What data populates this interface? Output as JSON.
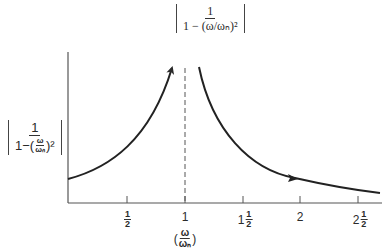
{
  "figure": {
    "top_formula": {
      "numerator": "1",
      "denominator": "1 − (ω/ωₙ)²"
    },
    "y_axis_label": {
      "numerator": "1",
      "denominator_prefix": "1−(",
      "inner_num": "ω",
      "inner_den": "ωₙ",
      "denominator_suffix": ")²"
    },
    "x_axis_label": {
      "open": "(",
      "inner_num": "ω",
      "inner_den": "ωₙ",
      "close": ")"
    },
    "x_ticks": [
      {
        "whole": "",
        "num": "1",
        "den": "2",
        "value": 0.5
      },
      {
        "whole": "1",
        "num": "",
        "den": "",
        "value": 1
      },
      {
        "whole": "1",
        "num": "1",
        "den": "2",
        "value": 1.5
      },
      {
        "whole": "2",
        "num": "",
        "den": "",
        "value": 2
      },
      {
        "whole": "2",
        "num": "1",
        "den": "2",
        "value": 2.5
      }
    ],
    "asymptote": {
      "x": 1,
      "style": "dashed"
    },
    "curves": [
      {
        "name": "below-resonance",
        "x_range": [
          0,
          0.97
        ],
        "direction": "increasing toward asymptote",
        "arrow": "end"
      },
      {
        "name": "above-resonance",
        "x_range": [
          1.03,
          2.7
        ],
        "direction": "decreasing toward zero",
        "arrow": "mid"
      }
    ]
  }
}
